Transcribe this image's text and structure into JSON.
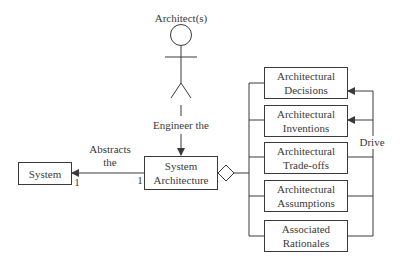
{
  "actor": {
    "label": "Architect(s)"
  },
  "relations": {
    "engineer": "Engineer the",
    "abstracts_line1": "Abstracts",
    "abstracts_line2": "the",
    "drive": "Drive",
    "multiplicity_system": "1",
    "multiplicity_architecture": "1"
  },
  "nodes": {
    "system": {
      "label": "System"
    },
    "system_architecture": {
      "line1": "System",
      "line2": "Architecture"
    },
    "parts": [
      {
        "line1": "Architectural",
        "line2": "Decisions"
      },
      {
        "line1": "Architectural",
        "line2": "Inventions"
      },
      {
        "line1": "Architectural",
        "line2": "Trade-offs"
      },
      {
        "line1": "Architectural",
        "line2": "Assumptions"
      },
      {
        "line1": "Associated",
        "line2": "Rationales"
      }
    ]
  },
  "colors": {
    "line": "#3a3a3a",
    "background": "#ffffff"
  }
}
